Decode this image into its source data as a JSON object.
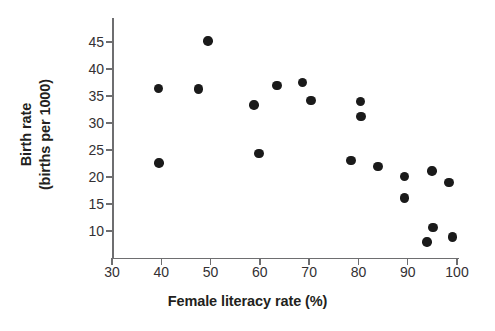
{
  "figure": {
    "background_color": "#ffffff",
    "axis_color": "#6e6e70",
    "tick_label_color": "#333033",
    "point_color": "#1a1a1a"
  },
  "chart_data": {
    "type": "scatter",
    "title": "",
    "xlabel": "Female literacy rate (%)",
    "ylabel_line1": "Birth rate",
    "ylabel_line2": "(births per 1000)",
    "ylabel": "Birth rate (births per 1000)",
    "xlim": [
      30,
      102
    ],
    "ylim": [
      6,
      47
    ],
    "xticks": [
      30,
      40,
      50,
      60,
      70,
      80,
      90,
      100
    ],
    "xtick_labels": [
      "30",
      "40",
      "50",
      "60",
      "70",
      "80",
      "90",
      "100"
    ],
    "yticks": [
      10,
      15,
      20,
      25,
      30,
      35,
      40,
      45
    ],
    "ytick_labels": [
      "10",
      "15",
      "20",
      "25",
      "30",
      "35",
      "40",
      "45"
    ],
    "grid": false,
    "legend": null,
    "marker": "filled-circle",
    "series": [
      {
        "name": "countries",
        "points": [
          {
            "x": 39.4,
            "y": 36.4
          },
          {
            "x": 39.5,
            "y": 22.6
          },
          {
            "x": 47.6,
            "y": 36.3
          },
          {
            "x": 49.5,
            "y": 45.2
          },
          {
            "x": 58.8,
            "y": 33.3
          },
          {
            "x": 59.8,
            "y": 24.4
          },
          {
            "x": 63.5,
            "y": 37.0
          },
          {
            "x": 68.7,
            "y": 37.5
          },
          {
            "x": 70.4,
            "y": 34.2
          },
          {
            "x": 78.5,
            "y": 23.1
          },
          {
            "x": 80.4,
            "y": 34.0
          },
          {
            "x": 80.5,
            "y": 31.2
          },
          {
            "x": 84.0,
            "y": 22.0
          },
          {
            "x": 89.4,
            "y": 20.1
          },
          {
            "x": 89.4,
            "y": 16.1
          },
          {
            "x": 93.9,
            "y": 8.0
          },
          {
            "x": 94.9,
            "y": 21.1
          },
          {
            "x": 95.1,
            "y": 10.7
          },
          {
            "x": 98.4,
            "y": 19.0
          },
          {
            "x": 99.1,
            "y": 8.9
          }
        ]
      }
    ]
  }
}
